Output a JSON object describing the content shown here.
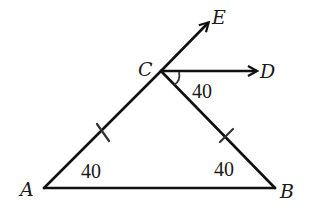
{
  "figure": {
    "type": "geometry-triangle",
    "points": {
      "A": {
        "label": "A",
        "x": 44,
        "y": 188
      },
      "B": {
        "label": "B",
        "x": 275,
        "y": 188
      },
      "C": {
        "label": "C",
        "x": 161,
        "y": 71
      },
      "D": {
        "label": "D",
        "x": 256,
        "y": 71
      },
      "E": {
        "label": "E",
        "x": 210,
        "y": 20
      }
    },
    "angles": {
      "A": "40",
      "B": "40",
      "DCB": "40"
    },
    "segments": [
      "AB",
      "AC",
      "CB"
    ],
    "rays": [
      "CE",
      "CD"
    ],
    "equal_marks": [
      "AC",
      "CB"
    ]
  }
}
